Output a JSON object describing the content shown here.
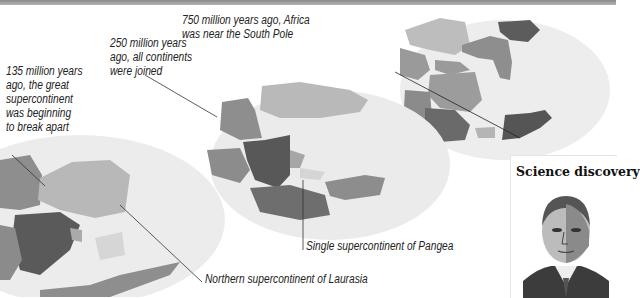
{
  "header": {
    "partial_title": "Earth"
  },
  "maps": [
    {
      "id": "135mya",
      "caption": "135 million years\nago, the great\nsupercontinent\nwas beginning\nto break apart"
    },
    {
      "id": "250mya",
      "caption": "250 million years\nago, all continents\nwere joined"
    },
    {
      "id": "750mya",
      "caption": "750 million years ago, Africa\nwas near the South Pole"
    }
  ],
  "callouts": {
    "pangea": "Single supercontinent of Pangea",
    "laurasia": "Northern supercontinent of Laurasia"
  },
  "sidebar": {
    "title": "Science discovery",
    "portrait": "portrait-of-scientist"
  },
  "colors": {
    "globe": "#ececec",
    "land_light": "#b9b9b9",
    "land_mid": "#8f8f8f",
    "land_dark": "#5a5a5a",
    "land_pale": "#d0d0d0"
  }
}
